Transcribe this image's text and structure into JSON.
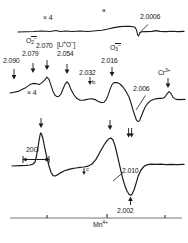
{
  "figure": {
    "kind": "epr-spectra",
    "panels": [
      "a",
      "b",
      "c"
    ],
    "ink": "#1a1a1a",
    "background": "#ffffff"
  },
  "annotations": {
    "panel_a_label": "a",
    "panel_b_label": "b",
    "panel_c_label": "c",
    "gain_top": "× 4",
    "gain_mid": "× 4",
    "scale_bar": "20G",
    "g_2_0006": "2.0006",
    "g_2_090": "2.090",
    "g_2_079": "2.079",
    "g_2_070": "2.070",
    "g_2_054": "2.054",
    "g_2_032": "2.032",
    "g_2_016": "2.016",
    "g_2_006": "2.006",
    "g_2_010": "2.010",
    "g_2_002": "2.002"
  },
  "species": {
    "o2_minus": {
      "element": "O",
      "sub": "2",
      "sup": "–"
    },
    "li_o_center": {
      "open": "[",
      "li": "Li",
      "li_sup": "+",
      "o": "O",
      "o_sup": "–",
      "close": "]"
    },
    "o3_minus": {
      "element": "O",
      "sub": "3",
      "sup": "–"
    },
    "cr3": {
      "element": "Cr",
      "sup": "3+"
    },
    "mn4": {
      "element": "Mn",
      "sup": "4+"
    }
  },
  "chart_data": {
    "type": "line",
    "title": "",
    "xlabel": "Magnetic field",
    "ylabel": "EPR first-derivative signal",
    "grid": false,
    "legend": false,
    "axis": {
      "scale_bar_gauss": 20,
      "tick_positions_px": [
        47,
        107,
        165
      ]
    },
    "series": [
      {
        "name": "a",
        "gain": "× 4",
        "markers": [
          {
            "label": "2.0006",
            "x_px": 140,
            "type": "sharp-derivative"
          }
        ]
      },
      {
        "name": "b",
        "gain": "× 4",
        "markers": [
          {
            "label": "2.090",
            "x_px": 14,
            "assignment": "O2-"
          },
          {
            "label": "2.079",
            "x_px": 32,
            "assignment": "O2-"
          },
          {
            "label": "2.070",
            "x_px": 47,
            "assignment": "[Li+O-]"
          },
          {
            "label": "2.054",
            "x_px": 67,
            "assignment": "O2-"
          },
          {
            "label": "2.032",
            "x_px": 90,
            "assignment": "b"
          },
          {
            "label": "2.016",
            "x_px": 112,
            "assignment": "O3-"
          },
          {
            "label": "2.006",
            "x_px": 143,
            "assignment": ""
          },
          {
            "label": "Cr3+",
            "x_px": 168,
            "assignment": "Cr3+"
          }
        ]
      },
      {
        "name": "c",
        "gain": "",
        "markers": [
          {
            "label": "",
            "x_px": 40,
            "type": "peak"
          },
          {
            "label": "c",
            "x_px": 84,
            "type": "shoulder"
          },
          {
            "label": "",
            "x_px": 113,
            "type": "peak"
          },
          {
            "label": "2.010",
            "x_px": 124,
            "type": "inflection"
          },
          {
            "label": "2.002",
            "x_px": 130,
            "type": "trough"
          },
          {
            "label": "Mn4+",
            "x_px": 107,
            "type": "axis-tick"
          }
        ]
      }
    ]
  }
}
